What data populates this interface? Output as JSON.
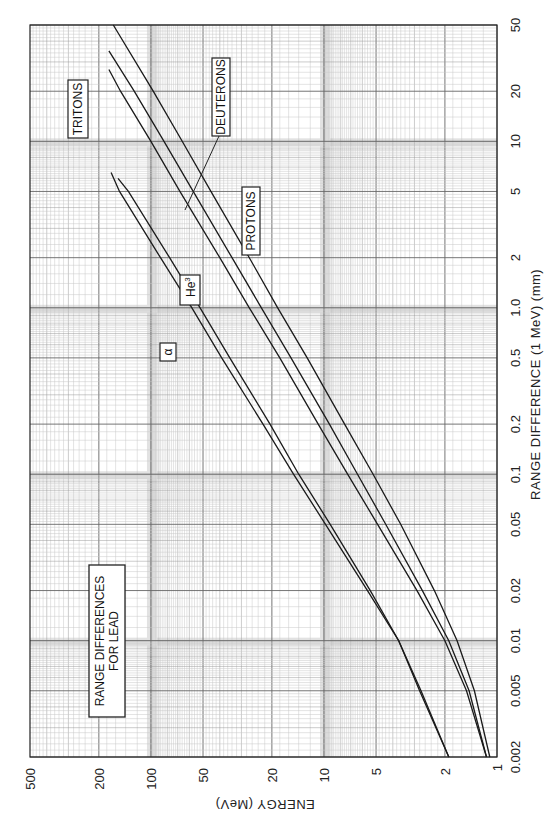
{
  "chart_data": {
    "type": "line",
    "title": "RANGE DIFFERENCES FOR LEAD",
    "xlabel": "RANGE DIFFERENCE (1 MeV) (mm)",
    "ylabel": "ENERGY (MeV)",
    "xscale": "log",
    "yscale": "log",
    "xlim": [
      0.002,
      50
    ],
    "ylim": [
      1,
      500
    ],
    "x_ticks": [
      "0.002",
      "0.005",
      "0.01",
      "0.02",
      "0.05",
      "0.1",
      "0.2",
      "0.5",
      "1.0",
      "2",
      "5",
      "10",
      "20",
      "50"
    ],
    "y_ticks": [
      "1",
      "2",
      "5",
      "10",
      "20",
      "50",
      "100",
      "200",
      "500"
    ],
    "grid": true,
    "orientation": "rotated 90° clockwise (energy axis along bottom, decreasing to the right; range axis along right side)",
    "series": [
      {
        "name": "PROTONS",
        "label": "PROTONS",
        "x": [
          0.002,
          0.005,
          0.01,
          0.02,
          0.05,
          0.1,
          0.2,
          0.5,
          1.0,
          2,
          5,
          10,
          20,
          50
        ],
        "y": [
          1.1,
          1.35,
          1.7,
          2.3,
          3.6,
          5.2,
          7.6,
          12.5,
          18.5,
          27,
          45,
          66,
          97,
          165
        ]
      },
      {
        "name": "DEUTERONS",
        "label": "DEUTERONS",
        "x": [
          0.002,
          0.005,
          0.01,
          0.02,
          0.05,
          0.1,
          0.2,
          0.5,
          1.0,
          2,
          5,
          10,
          20,
          35
        ],
        "y": [
          1.15,
          1.45,
          1.9,
          2.7,
          4.4,
          6.4,
          9.3,
          15.5,
          23,
          34,
          57,
          84,
          125,
          175
        ]
      },
      {
        "name": "TRITONS",
        "label": "TRITONS",
        "x": [
          0.002,
          0.005,
          0.01,
          0.02,
          0.05,
          0.1,
          0.2,
          0.5,
          1.0,
          2,
          5,
          10,
          20,
          27
        ],
        "y": [
          1.15,
          1.5,
          2.0,
          2.9,
          4.9,
          7.3,
          10.8,
          18,
          27,
          40,
          68,
          100,
          150,
          175
        ]
      },
      {
        "name": "He3",
        "label": "He3",
        "x": [
          0.002,
          0.005,
          0.01,
          0.02,
          0.05,
          0.1,
          0.2,
          0.5,
          1.0,
          2,
          5,
          6
        ],
        "y": [
          1.9,
          2.8,
          3.7,
          5.4,
          9.2,
          14,
          20.5,
          35,
          52,
          78,
          135,
          155
        ]
      },
      {
        "name": "alpha",
        "label": "α",
        "x": [
          0.002,
          0.005,
          0.01,
          0.02,
          0.05,
          0.1,
          0.2,
          0.5,
          1.0,
          2,
          5,
          6.5
        ],
        "y": [
          1.9,
          2.75,
          3.7,
          5.6,
          9.8,
          15,
          22.5,
          39,
          58,
          88,
          152,
          170
        ]
      }
    ],
    "annotations": [
      "RANGE DIFFERENCES FOR LEAD",
      "TRITONS",
      "DEUTERONS",
      "PROTONS",
      "He3",
      "α"
    ]
  },
  "labels": {
    "title_line1": "RANGE  DIFFERENCES",
    "title_line2": "FOR LEAD",
    "tritons": "TRITONS",
    "deuterons": "DEUTERONS",
    "protons": "PROTONS",
    "he3_base": "He",
    "he3_sup": "3",
    "alpha": "α",
    "energy_axis": "ENERGY (MeV)",
    "range_axis": "RANGE DIFFERENCE (1 MeV) (mm)"
  }
}
